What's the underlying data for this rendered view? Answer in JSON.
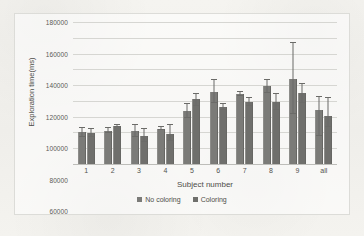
{
  "chart_data": {
    "type": "bar",
    "title": "",
    "xlabel": "Subject number",
    "ylabel": "Exploration time(ms)",
    "ylim": [
      0,
      180000
    ],
    "ytick_step": 20000,
    "yticks": [
      "180000",
      "160000",
      "140000",
      "120000",
      "100000",
      "80000",
      "60000",
      "40000",
      "20000",
      "0"
    ],
    "grid": true,
    "legend_position": "bottom",
    "categories": [
      "1",
      "2",
      "3",
      "4",
      "5",
      "6",
      "7",
      "8",
      "9",
      "all"
    ],
    "series": [
      {
        "name": "No coloring",
        "color": "#7b7b78",
        "values": [
          40000,
          42000,
          42000,
          45000,
          67000,
          91000,
          89000,
          99000,
          108000,
          68000
        ],
        "err_low": [
          34000,
          39000,
          34000,
          43000,
          58000,
          77000,
          86000,
          90000,
          63000,
          36000
        ],
        "err_high": [
          46000,
          46000,
          50000,
          46500,
          76000,
          106000,
          91000,
          106000,
          153000,
          85000
        ]
      },
      {
        "name": "Coloring",
        "color": "#6f6f6c",
        "values": [
          39000,
          48000,
          35000,
          38500,
          82000,
          72000,
          79000,
          78000,
          90000,
          61000
        ],
        "err_low": [
          34000,
          47000,
          28000,
          29000,
          74000,
          68000,
          73000,
          68000,
          77000,
          47000
        ],
        "err_high": [
          44000,
          49000,
          44000,
          50000,
          89000,
          76000,
          84000,
          89000,
          102000,
          84000
        ]
      }
    ]
  },
  "legend": {
    "items": [
      {
        "label": "No coloring"
      },
      {
        "label": "Coloring"
      }
    ]
  },
  "axes": {
    "x_title": "Subject number",
    "y_title": "Exploration time(ms)"
  }
}
